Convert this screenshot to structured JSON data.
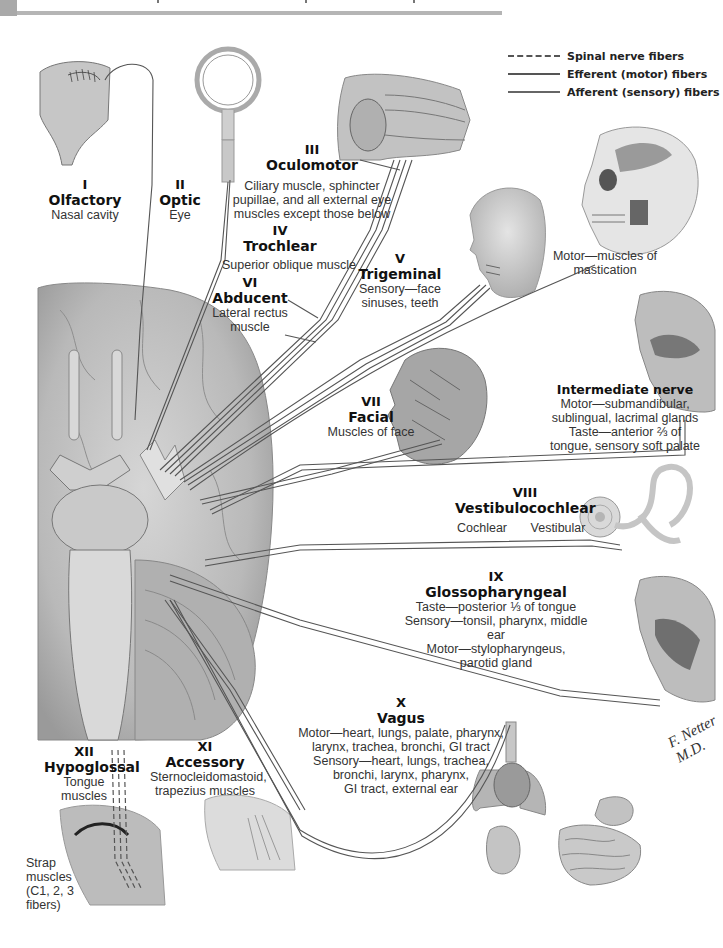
{
  "legend": {
    "items": [
      {
        "style": "dashed",
        "label": "Spinal nerve fibers"
      },
      {
        "style": "solid",
        "label": "Efferent (motor) fibers"
      },
      {
        "style": "solid",
        "label": "Afferent (sensory) fibers"
      }
    ]
  },
  "nerves": {
    "olfactory": {
      "numeral": "I",
      "name": "Olfactory",
      "desc": [
        "Nasal cavity"
      ]
    },
    "optic": {
      "numeral": "II",
      "name": "Optic",
      "desc": [
        "Eye"
      ]
    },
    "oculomotor": {
      "numeral": "III",
      "name": "Oculomotor",
      "desc": [
        "Ciliary muscle, sphincter",
        "pupillae, and all external eye",
        "muscles except those below"
      ]
    },
    "trochlear": {
      "numeral": "IV",
      "name": "Trochlear",
      "desc": [
        "Superior oblique muscle"
      ]
    },
    "trigeminal": {
      "numeral": "V",
      "name": "Trigeminal",
      "desc": [
        "Sensory—face",
        "sinuses, teeth"
      ],
      "motor_desc": [
        "Motor—muscles of",
        "mastication"
      ]
    },
    "abducent": {
      "numeral": "VI",
      "name": "Abducent",
      "desc": [
        "Lateral rectus",
        "muscle"
      ]
    },
    "facial": {
      "numeral": "VII",
      "name": "Facial",
      "desc": [
        "Muscles of face"
      ]
    },
    "intermediate": {
      "name": "Intermediate nerve",
      "desc": [
        "Motor—submandibular,",
        "sublingual, lacrimal glands",
        "Taste—anterior ⅔ of",
        "tongue, sensory soft palate"
      ]
    },
    "vestibulocochlear": {
      "numeral": "VIII",
      "name": "Vestibulocochlear",
      "branches": [
        "Cochlear",
        "Vestibular"
      ]
    },
    "glossopharyngeal": {
      "numeral": "IX",
      "name": "Glossopharyngeal",
      "desc": [
        "Taste—posterior ⅓ of tongue",
        "Sensory—tonsil, pharynx, middle ear",
        "Motor—stylopharyngeus,",
        "parotid gland"
      ]
    },
    "vagus": {
      "numeral": "X",
      "name": "Vagus",
      "desc": [
        "Motor—heart, lungs, palate, pharynx,",
        "larynx, trachea, bronchi, GI tract",
        "Sensory—heart, lungs, trachea,",
        "bronchi, larynx, pharynx,",
        "GI tract, external ear"
      ]
    },
    "accessory": {
      "numeral": "XI",
      "name": "Accessory",
      "desc": [
        "Sternocleidomastoid,",
        "trapezius muscles"
      ]
    },
    "hypoglossal": {
      "numeral": "XII",
      "name": "Hypoglossal",
      "desc": [
        "Tongue",
        "muscles"
      ]
    },
    "strap": {
      "desc": [
        "Strap",
        "muscles",
        "(C1, 2, 3",
        "fibers)"
      ]
    }
  },
  "signature": "F. Netter M.D.",
  "colors": {
    "fiber": "#555555",
    "illustration": "#b8b8b8",
    "rule": "#b5b5b5"
  }
}
